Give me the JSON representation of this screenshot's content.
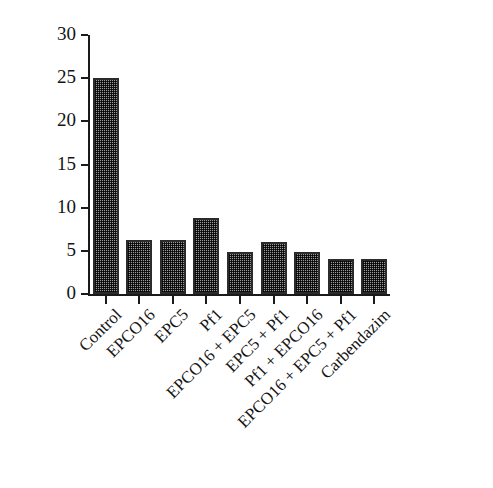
{
  "chart_data": {
    "type": "bar",
    "title": "",
    "xlabel": "",
    "ylabel": "Disease index (%)",
    "ylim": [
      0,
      30
    ],
    "yticks": [
      0,
      5,
      10,
      15,
      20,
      25,
      30
    ],
    "ytick_labels": [
      "0",
      "5",
      "10",
      "15",
      "20",
      "25",
      "30"
    ],
    "grid": false,
    "legend": null,
    "categories": [
      "Control",
      "EPCO16",
      "EPC5",
      "Pf1",
      "EPCO16 + EPC5",
      "EPC5 + Pf1",
      "Pf1 + EPCO16",
      "EPCO16 + EPC5 + Pf1",
      "Carbendazim"
    ],
    "values": [
      25.0,
      6.3,
      6.3,
      8.8,
      4.9,
      6.0,
      4.9,
      4.0,
      4.0
    ],
    "bar_fill": "checkerboard-hatch",
    "bar_color": "#9a9a9a",
    "bar_edge_color": "#2b2b2b",
    "axis_color": "#1a1a1a",
    "background_color": "#ffffff"
  }
}
